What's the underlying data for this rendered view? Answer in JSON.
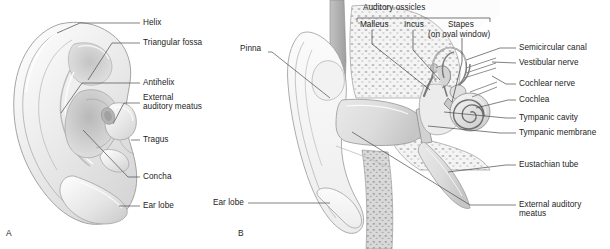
{
  "figure": {
    "background_color": "#ffffff",
    "line_color": "#5d5d5d",
    "text_color": "#1d1d1d"
  },
  "panels": [
    {
      "letter": "A",
      "name": "external-ear-surface-view",
      "labels": [
        {
          "id": "helix",
          "text": "Helix"
        },
        {
          "id": "triangular-fossa",
          "text": "Triangular fossa"
        },
        {
          "id": "antihelix",
          "text": "Antihelix"
        },
        {
          "id": "external-auditory-meatus-line1",
          "text": "External"
        },
        {
          "id": "external-auditory-meatus-line2",
          "text": "auditory meatus"
        },
        {
          "id": "tragus",
          "text": "Tragus"
        },
        {
          "id": "concha",
          "text": "Concha"
        },
        {
          "id": "ear-lobe",
          "text": "Ear lobe"
        }
      ]
    },
    {
      "letter": "B",
      "name": "ear-cross-section-view",
      "bracket": {
        "title": "Auditory ossicles",
        "items": [
          {
            "id": "malleus",
            "text": "Malleus"
          },
          {
            "id": "incus",
            "text": "Incus"
          },
          {
            "id": "stapes",
            "text": "Stapes"
          }
        ],
        "sub_note": "(on oval window)"
      },
      "labels": [
        {
          "id": "pinna",
          "text": "Pinna"
        },
        {
          "id": "ear-lobe-b",
          "text": "Ear lobe"
        },
        {
          "id": "semicircular-canal",
          "text": "Semicircular canal"
        },
        {
          "id": "vestibular-nerve",
          "text": "Vestibular nerve"
        },
        {
          "id": "cochlear-nerve",
          "text": "Cochlear nerve"
        },
        {
          "id": "cochlea",
          "text": "Cochlea"
        },
        {
          "id": "tympanic-cavity",
          "text": "Tympanic cavity"
        },
        {
          "id": "tympanic-membrane",
          "text": "Tympanic membrane"
        },
        {
          "id": "eustachian-tube",
          "text": "Eustachian tube"
        },
        {
          "id": "external-auditory-meatus-b-line1",
          "text": "External auditory"
        },
        {
          "id": "external-auditory-meatus-b-line2",
          "text": "meatus"
        }
      ]
    }
  ]
}
